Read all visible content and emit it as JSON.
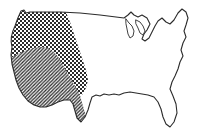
{
  "figure": {
    "background_color": "#ffffff",
    "outline_color": "#2b2b2b",
    "width_px": 205,
    "height_px": 138
  },
  "map": {
    "subject": "contiguous-united-states",
    "projection_note": "simplified national outline, no state borders",
    "features": [
      {
        "name": "northern-border",
        "label": "Canada border",
        "description": "near-straight horizontal line across the top"
      },
      {
        "name": "great-lakes",
        "label": "Great Lakes",
        "description": "notched coastline with Michigan peninsula in the upper right"
      },
      {
        "name": "atlantic-coast",
        "label": "Atlantic coast",
        "description": "irregular eastern seaboard including New England"
      },
      {
        "name": "florida-peninsula",
        "label": "Florida",
        "description": "narrow peninsula extending south on the lower right"
      },
      {
        "name": "gulf-coast",
        "label": "Gulf of Mexico coast",
        "description": "scalloped southern coastline"
      },
      {
        "name": "pacific-coast",
        "label": "Pacific coast",
        "description": "west coast curving inward toward the south"
      }
    ]
  },
  "regions": [
    {
      "id": "dotted-region",
      "label": "Northwest and Mountain West",
      "pattern": "dotted-checkerboard",
      "pattern_description": "fine dense checkerboard of dark squares",
      "fill_color": "#2b2b2b",
      "coverage": "Pacific Northwest through the northern Mountain West and northern Plains"
    },
    {
      "id": "hatched-region",
      "label": "Southwest and Texas",
      "pattern": "diagonal-hatch",
      "pattern_description": "45 degree diagonal lines running lower-left to upper-right",
      "fill_color": "#2b2b2b",
      "coverage": "Southwest desert states and Texas"
    }
  ],
  "legend": {
    "visible": false,
    "items": []
  },
  "annotations": {
    "visible": false,
    "items": []
  }
}
